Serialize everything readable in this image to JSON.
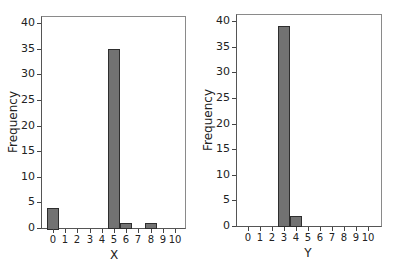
{
  "chart_data": [
    {
      "type": "bar",
      "title": "",
      "xlabel": "X",
      "ylabel": "Frequency",
      "categories": [
        "0",
        "1",
        "2",
        "3",
        "4",
        "5",
        "6",
        "7",
        "8",
        "9",
        "10"
      ],
      "values": [
        4,
        0,
        0,
        0,
        0,
        35,
        1,
        0,
        1,
        0,
        0
      ],
      "ylim": [
        0,
        40
      ],
      "yticks": [
        0,
        5,
        10,
        15,
        20,
        25,
        30,
        35,
        40
      ],
      "grid": false,
      "bar_color": "#727272"
    },
    {
      "type": "bar",
      "title": "",
      "xlabel": "Y",
      "ylabel": "Frequency",
      "categories": [
        "0",
        "1",
        "2",
        "3",
        "4",
        "5",
        "6",
        "7",
        "8",
        "9",
        "10"
      ],
      "values": [
        0,
        0,
        0,
        39,
        2,
        0,
        0,
        0,
        0,
        0,
        0
      ],
      "ylim": [
        0,
        40
      ],
      "yticks": [
        0,
        5,
        10,
        15,
        20,
        25,
        30,
        35,
        40
      ],
      "grid": false,
      "bar_color": "#727272"
    }
  ],
  "charts": [
    {
      "xlabel": "X",
      "ylabel": "Frequency"
    },
    {
      "xlabel": "Y",
      "ylabel": "Frequency"
    }
  ]
}
